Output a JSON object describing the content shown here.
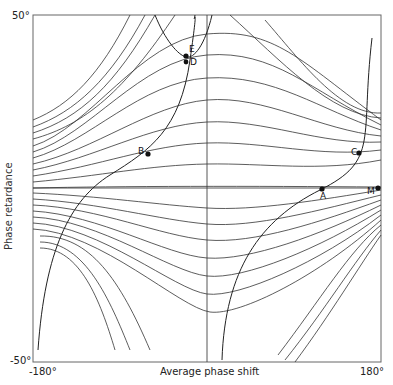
{
  "figure": {
    "x_axis": {
      "label": "Average phase shift",
      "min_label": "-180°",
      "max_label": "180°"
    },
    "y_axis": {
      "label": "Phase retardance",
      "max_label": "50°",
      "min_label": "-50°"
    },
    "points": [
      {
        "id": "A",
        "label": "A"
      },
      {
        "id": "B",
        "label": "B"
      },
      {
        "id": "C",
        "label": "C"
      },
      {
        "id": "D",
        "label": "D"
      },
      {
        "id": "E",
        "label": "E"
      },
      {
        "id": "M",
        "label": "M"
      }
    ],
    "colors": {
      "line": "#333333",
      "frame": "#555555",
      "background": "#ffffff"
    }
  }
}
